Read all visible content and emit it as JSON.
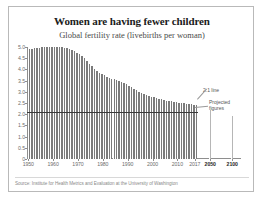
{
  "chart_data": {
    "type": "bar",
    "title": "Women are having fewer children",
    "subtitle": "Global fertility rate (livebirths per woman)",
    "xlabel": "",
    "ylabel": "",
    "ylim": [
      0,
      5.0
    ],
    "ytick_labels": [
      "5.0",
      "4.5",
      "4.0",
      "3.5",
      "3.0",
      "2.5",
      "2.0",
      "1.5",
      "1.0",
      "0.5",
      "0"
    ],
    "ytick_values": [
      5.0,
      4.5,
      4.0,
      3.5,
      3.0,
      2.5,
      2.0,
      1.5,
      1.0,
      0.5,
      0
    ],
    "xtick_labels": [
      "1950",
      "1960",
      "1970",
      "1980",
      "1990",
      "2000",
      "2010",
      "2017",
      "2050",
      "2100"
    ],
    "xtick_values": [
      1950,
      1960,
      1970,
      1980,
      1990,
      2000,
      2010,
      2017,
      2050,
      2100
    ],
    "grid": false,
    "legend": "none",
    "reference_line": {
      "value": 2.1,
      "label": "2.1 line"
    },
    "annotations": [
      {
        "text": "2.1 line",
        "target": "reference-line"
      },
      {
        "text": "Projected",
        "target": "projection-bars"
      },
      {
        "text": "figures",
        "target": "projection-bars"
      }
    ],
    "series": [
      {
        "name": "Global fertility rate",
        "kind": "historical",
        "x": [
          1950,
          1951,
          1952,
          1953,
          1954,
          1955,
          1956,
          1957,
          1958,
          1959,
          1960,
          1961,
          1962,
          1963,
          1964,
          1965,
          1966,
          1967,
          1968,
          1969,
          1970,
          1971,
          1972,
          1973,
          1974,
          1975,
          1976,
          1977,
          1978,
          1979,
          1980,
          1981,
          1982,
          1983,
          1984,
          1985,
          1986,
          1987,
          1988,
          1989,
          1990,
          1991,
          1992,
          1993,
          1994,
          1995,
          1996,
          1997,
          1998,
          1999,
          2000,
          2001,
          2002,
          2003,
          2004,
          2005,
          2006,
          2007,
          2008,
          2009,
          2010,
          2011,
          2012,
          2013,
          2014,
          2015,
          2016,
          2017
        ],
        "values": [
          4.9,
          4.92,
          4.94,
          4.96,
          4.97,
          4.98,
          5.0,
          5.01,
          5.01,
          5.02,
          5.02,
          5.01,
          5.0,
          4.99,
          4.97,
          4.94,
          4.9,
          4.85,
          4.8,
          4.74,
          4.68,
          4.6,
          4.5,
          4.38,
          4.26,
          4.14,
          4.03,
          3.94,
          3.86,
          3.8,
          3.74,
          3.68,
          3.63,
          3.59,
          3.55,
          3.51,
          3.47,
          3.43,
          3.39,
          3.34,
          3.28,
          3.21,
          3.14,
          3.07,
          3.0,
          2.94,
          2.89,
          2.85,
          2.81,
          2.78,
          2.75,
          2.72,
          2.69,
          2.66,
          2.64,
          2.61,
          2.59,
          2.57,
          2.55,
          2.53,
          2.51,
          2.49,
          2.48,
          2.46,
          2.45,
          2.44,
          2.43,
          2.4
        ]
      },
      {
        "name": "Projected fertility rate",
        "kind": "projected",
        "x": [
          2050,
          2100
        ],
        "values": [
          2.2,
          1.9
        ]
      }
    ]
  },
  "source": {
    "prefix": "Source:",
    "text": "Institute for Health Metrics and Evaluation at the University of Washington"
  }
}
